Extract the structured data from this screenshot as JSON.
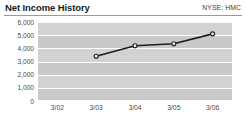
{
  "header": {
    "title": "Net Income History",
    "ticker": "NYSE: HMC"
  },
  "chart_data": {
    "type": "line",
    "title": "Net Income History",
    "subtitle": "NYSE: HMC",
    "xlabel": "",
    "ylabel": "",
    "categories": [
      "3/02",
      "3/03",
      "3/04",
      "3/05",
      "3/06"
    ],
    "x": [
      "3/02",
      "3/03",
      "3/04",
      "3/05",
      "3/06"
    ],
    "values": [
      null,
      3400,
      4200,
      4350,
      5100
    ],
    "series": [
      {
        "name": "Net Income",
        "values": [
          null,
          3400,
          4200,
          4350,
          5100
        ]
      }
    ],
    "ylim": [
      0,
      6000
    ],
    "yticks": [
      6000,
      5000,
      4000,
      3000,
      2000,
      1000,
      0
    ],
    "ytick_labels": [
      "6,000",
      "5,000",
      "4,000",
      "3,000",
      "2,000",
      "1,000",
      "0"
    ],
    "xtick_labels": [
      "3/02",
      "3/03",
      "3/04",
      "3/05",
      "3/06"
    ],
    "grid": true,
    "legend": false,
    "markers": true,
    "colors": {
      "line": "#1c1c1c",
      "marker_fill": "#f2f2f2",
      "plot_background": "#d2d2d2",
      "band": "#c9c9c9",
      "gridline": "#ffffff",
      "text": "#4a4a4a",
      "title": "#1a1a1a"
    }
  }
}
